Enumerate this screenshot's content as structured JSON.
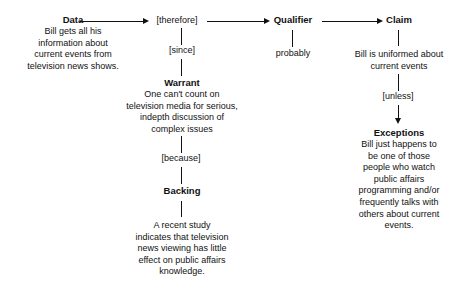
{
  "diagram": {
    "line_color": "#111111",
    "background_color": "#ffffff",
    "nodes": {
      "data": {
        "heading": "Data",
        "lines": [
          "Bill gets all his",
          "information about",
          "current events from",
          "television news shows."
        ]
      },
      "warrant": {
        "heading": "Warrant",
        "lines": [
          "One can't count on",
          "television media for serious,",
          "indepth discussion of",
          "complex issues"
        ]
      },
      "backing": {
        "heading": "Backing",
        "lines": [
          "A recent study",
          "indicates that television",
          "news viewing has little",
          "effect on public affairs",
          "knowledge."
        ]
      },
      "qualifier": {
        "heading": "Qualifier",
        "lines": [
          "probably"
        ]
      },
      "claim": {
        "heading": "Claim",
        "lines": [
          "Bill is uniformed about",
          "current events"
        ]
      },
      "exceptions": {
        "heading": "Exceptions",
        "lines": [
          "Bill just happens to",
          "be one of those",
          "people who watch",
          "public affairs",
          "programming and/or",
          "frequently talks with",
          "others about current",
          "events."
        ]
      }
    },
    "connectors": {
      "therefore": "[therefore]",
      "since": "[since]",
      "because": "[because]",
      "unless": "[unless]"
    }
  }
}
